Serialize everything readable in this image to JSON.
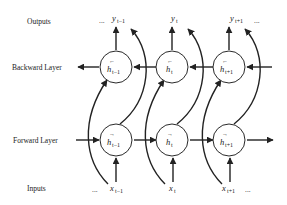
{
  "row_labels": {
    "outputs": "Outputs",
    "backward": "Backward Layer",
    "forward": "Forward Layer",
    "inputs": "Inputs"
  },
  "ellipsis": "...",
  "outputs": [
    {
      "base": "y",
      "sub": "t−1"
    },
    {
      "base": "y",
      "sub": "t"
    },
    {
      "base": "y",
      "sub": "t+1"
    }
  ],
  "backward_nodes": [
    {
      "base": "h",
      "arrow": "←",
      "sub": "t−1"
    },
    {
      "base": "h",
      "arrow": "←",
      "sub": "t"
    },
    {
      "base": "h",
      "arrow": "←",
      "sub": "t+1"
    }
  ],
  "forward_nodes": [
    {
      "base": "h",
      "arrow": "→",
      "sub": "t−1"
    },
    {
      "base": "h",
      "arrow": "→",
      "sub": "t"
    },
    {
      "base": "h",
      "arrow": "→",
      "sub": "t+1"
    }
  ],
  "inputs": [
    {
      "base": "x",
      "sub": "t−1"
    },
    {
      "base": "x",
      "sub": "t"
    },
    {
      "base": "x",
      "sub": "t+1"
    }
  ]
}
